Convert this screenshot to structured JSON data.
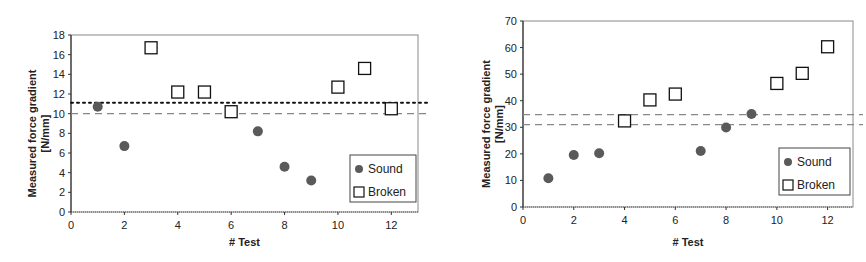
{
  "chart_data": [
    {
      "type": "scatter",
      "title": "",
      "xlabel": "# Test",
      "ylabel": [
        "Measured force gradient",
        "[N/mm]"
      ],
      "xlim": [
        0,
        13
      ],
      "ylim": [
        0,
        18
      ],
      "xticks": [
        0,
        2,
        4,
        6,
        8,
        10,
        12
      ],
      "yticks": [
        0,
        2,
        4,
        6,
        8,
        10,
        12,
        14,
        16,
        18
      ],
      "grid": false,
      "legend_position": "lower right",
      "series": [
        {
          "name": "Sound",
          "marker": "circle",
          "color": "#5a5a5a",
          "x": [
            1,
            2,
            7,
            8,
            9
          ],
          "y": [
            10.7,
            6.7,
            8.2,
            4.6,
            3.2
          ]
        },
        {
          "name": "Broken",
          "marker": "square-open",
          "color": "#111111",
          "x": [
            3,
            4,
            5,
            6,
            10,
            11,
            12
          ],
          "y": [
            16.7,
            12.2,
            12.2,
            10.2,
            12.7,
            14.6,
            10.5
          ]
        }
      ],
      "reference_lines": [
        {
          "y": 11.1,
          "style": "dotted",
          "color": "#111111"
        },
        {
          "y": 10.0,
          "style": "dashed",
          "color": "#888888"
        }
      ],
      "frame": {
        "left": 71,
        "top": 35,
        "right": 418,
        "bottom": 212
      },
      "legend_box": {
        "x": 350,
        "y": 155,
        "w": 66,
        "h": 47
      },
      "ylabel_x": 36,
      "xlabel_y": 246
    },
    {
      "type": "scatter",
      "title": "",
      "xlabel": "# Test",
      "ylabel": [
        "Measured force gradient",
        "[N/mm]"
      ],
      "xlim": [
        0,
        13
      ],
      "ylim": [
        0,
        70
      ],
      "xticks": [
        0,
        2,
        4,
        6,
        8,
        10,
        12
      ],
      "yticks": [
        0,
        10,
        20,
        30,
        40,
        50,
        60,
        70
      ],
      "grid": false,
      "legend_position": "lower right",
      "series": [
        {
          "name": "Sound",
          "marker": "circle",
          "color": "#5a5a5a",
          "x": [
            1,
            2,
            3,
            7,
            8,
            9
          ],
          "y": [
            10.8,
            19.6,
            20.2,
            21.1,
            29.9,
            35.0
          ]
        },
        {
          "name": "Broken",
          "marker": "square-open",
          "color": "#111111",
          "x": [
            4,
            5,
            6,
            10,
            11,
            12
          ],
          "y": [
            32.4,
            40.3,
            42.5,
            46.5,
            50.3,
            60.3
          ]
        }
      ],
      "reference_lines": [
        {
          "y": 34.8,
          "style": "dashed",
          "color": "#888888"
        },
        {
          "y": 31.0,
          "style": "dashed",
          "color": "#888888"
        }
      ],
      "frame": {
        "left": 523,
        "top": 21,
        "right": 853,
        "bottom": 207
      },
      "legend_box": {
        "x": 779,
        "y": 148,
        "w": 71,
        "h": 47
      },
      "ylabel_x": 490,
      "xlabel_y": 246
    }
  ]
}
